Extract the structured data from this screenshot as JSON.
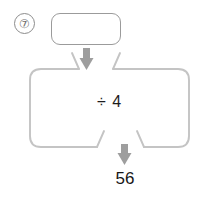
{
  "worksheet": {
    "problem_number": "⑦",
    "problem_number_plain": "7",
    "marker_icon": "circled-number-icon"
  },
  "machine": {
    "input_box": {
      "value": "",
      "placeholder": "",
      "description": "empty-answer-box"
    },
    "operation_label": "÷ 4",
    "operator": "÷",
    "operand": "4",
    "output_value": "56",
    "input_arrow_icon": "arrow-down-icon",
    "output_arrow_icon": "arrow-down-icon"
  },
  "colors": {
    "outline": "#bdbdbd",
    "box_outline": "#9b9b9b",
    "arrow": "#9e9e9e",
    "marker": "#8c8c8c",
    "text": "#1d1d1d",
    "background": "#ffffff"
  }
}
